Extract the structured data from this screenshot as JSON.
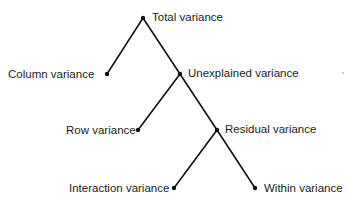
{
  "diagram": {
    "type": "tree",
    "nodes": [
      {
        "id": "total",
        "label": "Total variance",
        "x": 143,
        "y": 18,
        "label_side": "right"
      },
      {
        "id": "column",
        "label": "Column variance",
        "x": 107,
        "y": 74,
        "label_side": "left"
      },
      {
        "id": "unexplained",
        "label": "Unexplained variance",
        "x": 180,
        "y": 74,
        "label_side": "right"
      },
      {
        "id": "row",
        "label": "Row variance",
        "x": 138,
        "y": 130,
        "label_side": "left"
      },
      {
        "id": "residual",
        "label": "Residual variance",
        "x": 217,
        "y": 130,
        "label_side": "right"
      },
      {
        "id": "interaction",
        "label": "Interaction variance",
        "x": 174,
        "y": 188,
        "label_side": "left"
      },
      {
        "id": "within",
        "label": "Within variance",
        "x": 255,
        "y": 188,
        "label_side": "right"
      }
    ],
    "edges": [
      {
        "from": "total",
        "to": "column"
      },
      {
        "from": "total",
        "to": "unexplained"
      },
      {
        "from": "unexplained",
        "to": "row"
      },
      {
        "from": "unexplained",
        "to": "residual"
      },
      {
        "from": "residual",
        "to": "interaction"
      },
      {
        "from": "residual",
        "to": "within"
      }
    ],
    "line_color": "#111111"
  }
}
